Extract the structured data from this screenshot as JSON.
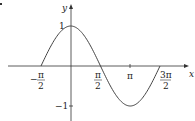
{
  "chart_data": {
    "type": "line",
    "title": "",
    "function": "y = cos x",
    "xlabel": "x",
    "ylabel": "y",
    "x_ticks": [
      {
        "value": -1.5708,
        "label_num": "π",
        "label_den": "2",
        "sign": "−"
      },
      {
        "value": 1.5708,
        "label_num": "π",
        "label_den": "2",
        "sign": ""
      },
      {
        "value": 3.1416,
        "label": "π"
      },
      {
        "value": 4.7124,
        "label_num": "3π",
        "label_den": "2",
        "sign": ""
      }
    ],
    "y_ticks": [
      {
        "value": 1,
        "label": "1"
      },
      {
        "value": -1,
        "label": "−1"
      }
    ],
    "xlim": [
      -1.5708,
      4.7124
    ],
    "ylim": [
      -1,
      1
    ],
    "series": [
      {
        "name": "cos x",
        "x": [
          -1.5708,
          -0.7854,
          0,
          0.7854,
          1.5708,
          2.3562,
          3.1416,
          3.927,
          4.7124
        ],
        "values": [
          0,
          0.7071,
          1,
          0.7071,
          0,
          -0.7071,
          -1,
          -0.7071,
          0
        ]
      }
    ],
    "grid": false,
    "legend": "none",
    "colors": {
      "axis": "#333333",
      "curve": "#444444"
    }
  },
  "labels": {
    "x_axis": "x",
    "y_axis": "y",
    "y_one": "1",
    "y_neg_one": "−1",
    "neg_pi_half_sign": "−",
    "pi": "π",
    "two": "2",
    "three_pi": "3π"
  }
}
